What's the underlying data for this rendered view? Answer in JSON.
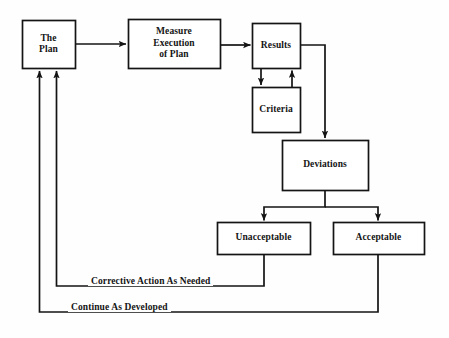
{
  "diagram": {
    "type": "flowchart",
    "background_color": "#fefefe",
    "line_color": "#141414",
    "text_color": "#141414",
    "nodes": [
      {
        "id": "the-plan",
        "label": "The\nPlan",
        "x": 22,
        "y": 20,
        "w": 53,
        "h": 48
      },
      {
        "id": "measure",
        "label": "Measure\nExecution\nof Plan",
        "x": 128,
        "y": 19,
        "w": 92,
        "h": 49
      },
      {
        "id": "results",
        "label": "Results",
        "x": 252,
        "y": 23,
        "w": 48,
        "h": 45
      },
      {
        "id": "criteria",
        "label": "Criteria",
        "x": 252,
        "y": 87,
        "w": 48,
        "h": 45
      },
      {
        "id": "deviations",
        "label": "Deviations",
        "x": 282,
        "y": 140,
        "w": 86,
        "h": 50
      },
      {
        "id": "unacceptable",
        "label": "Unacceptable",
        "x": 217,
        "y": 222,
        "w": 93,
        "h": 32
      },
      {
        "id": "acceptable",
        "label": "Acceptable",
        "x": 333,
        "y": 222,
        "w": 91,
        "h": 32
      }
    ],
    "edge_labels": [
      {
        "id": "corrective-action",
        "text": "Corrective Action As Needed",
        "x": 88,
        "y": 278
      },
      {
        "id": "continue-developed",
        "text": "Continue As Developed",
        "x": 68,
        "y": 304
      }
    ],
    "edges": [
      {
        "id": "plan-to-measure",
        "from": "the-plan",
        "to": "measure",
        "arrow": true
      },
      {
        "id": "measure-to-results",
        "from": "measure",
        "to": "results",
        "arrow": true
      },
      {
        "id": "results-to-criteria",
        "from": "results",
        "to": "criteria",
        "arrow": true
      },
      {
        "id": "criteria-to-results",
        "from": "criteria",
        "to": "results",
        "arrow": true
      },
      {
        "id": "results-to-deviations",
        "from": "results",
        "to": "deviations",
        "arrow": true
      },
      {
        "id": "deviations-to-unacceptable",
        "from": "deviations",
        "to": "unacceptable",
        "arrow": true
      },
      {
        "id": "deviations-to-acceptable",
        "from": "deviations",
        "to": "acceptable",
        "arrow": true
      },
      {
        "id": "unacceptable-to-plan",
        "from": "unacceptable",
        "to": "the-plan",
        "arrow": true,
        "label": "Corrective Action As Needed"
      },
      {
        "id": "acceptable-to-plan",
        "from": "acceptable",
        "to": "the-plan",
        "arrow": true,
        "label": "Continue As Developed"
      }
    ]
  }
}
